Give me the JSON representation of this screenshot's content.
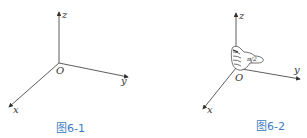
{
  "figures": [
    {
      "id": "fig1",
      "caption": "图6-1",
      "axes": {
        "x": "x",
        "y": "y",
        "z": "z",
        "origin": "O"
      }
    },
    {
      "id": "fig2",
      "caption": "图6-2",
      "axes": {
        "x": "x",
        "y": "y",
        "z": "z",
        "origin": "O"
      },
      "annotation": "π/2"
    }
  ],
  "colors": {
    "caption": "#3a7bbf",
    "lines": "#333333"
  }
}
